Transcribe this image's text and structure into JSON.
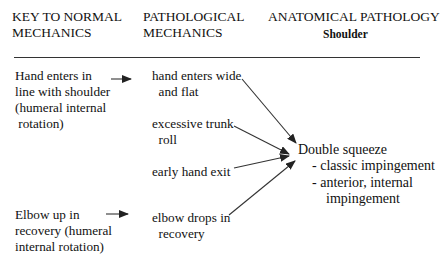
{
  "headers": {
    "col1": "KEY TO NORMAL\nMECHANICS",
    "col2": "PATHOLOGICAL\nMECHANICS",
    "col3": "ANATOMICAL PATHOLOGY",
    "col3_sub": "Shoulder"
  },
  "normal_mechanics": [
    {
      "text": "Hand enters in\nline with shoulder\n(humeral internal\n rotation)"
    },
    {
      "text": "Elbow up in\nrecovery (humeral\ninternal rotation)"
    }
  ],
  "pathological_mechanics": [
    {
      "text": "hand enters wide\n  and flat"
    },
    {
      "text": "excessive trunk\n  roll"
    },
    {
      "text": "early hand exit"
    },
    {
      "text": "elbow drops in\n  recovery"
    }
  ],
  "anatomical_pathology": {
    "title": "Double squeeze",
    "items": [
      "- classic impingement",
      "- anterior, internal\n    impingement"
    ]
  },
  "colors": {
    "text": "#111111",
    "lines": "#333333",
    "background": "#ffffff"
  }
}
